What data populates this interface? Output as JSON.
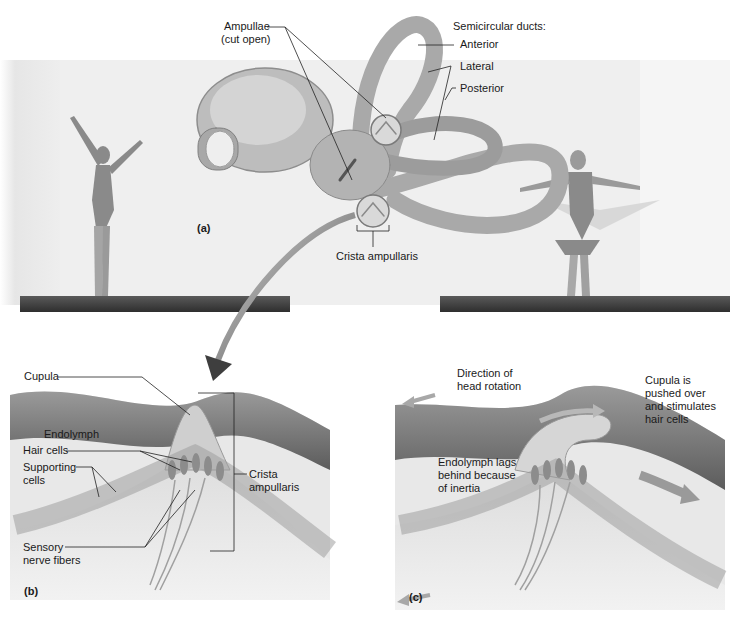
{
  "figure": {
    "panel_a": {
      "tag": "(a)",
      "labels": {
        "ampullae_line1": "Ampullae",
        "ampullae_line2": "(cut open)",
        "semicircular_ducts": "Semicircular ducts:",
        "anterior": "Anterior",
        "lateral": "Lateral",
        "posterior": "Posterior",
        "crista_ampullaris": "Crista ampullaris"
      }
    },
    "panel_b": {
      "tag": "(b)",
      "labels": {
        "cupula": "Cupula",
        "endolymph": "Endolymph",
        "hair_cells": "Hair cells",
        "supporting_line1": "Supporting",
        "supporting_line2": "cells",
        "sensory_line1": "Sensory",
        "sensory_line2": "nerve fibers",
        "crista_line1": "Crista",
        "crista_line2": "ampullaris"
      }
    },
    "panel_c": {
      "tag": "(c)",
      "labels": {
        "direction_line1": "Direction of",
        "direction_line2": "head rotation",
        "cupula_line1": "Cupula is",
        "cupula_line2": "pushed over",
        "cupula_line3": "and stimulates",
        "cupula_line4": "hair cells",
        "endolymph_line1": "Endolymph lags",
        "endolymph_line2": "behind because",
        "endolymph_line3": "of inertia"
      }
    }
  }
}
